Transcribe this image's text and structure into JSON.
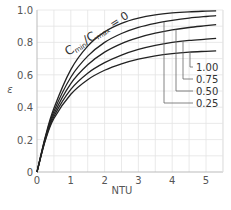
{
  "chart_data": {
    "type": "line",
    "title": "",
    "xlabel": "NTU",
    "ylabel": "ε",
    "xlim": [
      0,
      5.5
    ],
    "ylim": [
      0,
      1.0
    ],
    "grid": true,
    "x_ticks": [
      "0",
      "1",
      "2",
      "3",
      "4",
      "5"
    ],
    "y_ticks": [
      "0",
      "0.2",
      "0.4",
      "0.6",
      "0.8",
      "1.0"
    ],
    "annotation": "Cmin/Cmax = 0",
    "x": [
      0,
      0.25,
      0.5,
      1,
      1.5,
      2,
      2.5,
      3,
      3.5,
      4,
      4.5,
      5,
      5.3
    ],
    "series": [
      {
        "name": "0",
        "values": [
          0,
          0.221,
          0.393,
          0.632,
          0.777,
          0.865,
          0.918,
          0.95,
          0.97,
          0.982,
          0.989,
          0.993,
          0.995
        ]
      },
      {
        "name": "0.25",
        "values": [
          0,
          0.215,
          0.375,
          0.585,
          0.715,
          0.8,
          0.855,
          0.893,
          0.918,
          0.936,
          0.95,
          0.96,
          0.965
        ]
      },
      {
        "name": "0.50",
        "values": [
          0,
          0.209,
          0.358,
          0.546,
          0.662,
          0.74,
          0.793,
          0.83,
          0.857,
          0.877,
          0.892,
          0.903,
          0.91
        ]
      },
      {
        "name": "0.75",
        "values": [
          0,
          0.203,
          0.343,
          0.51,
          0.61,
          0.675,
          0.722,
          0.757,
          0.782,
          0.8,
          0.812,
          0.82,
          0.825
        ]
      },
      {
        "name": "1.00",
        "values": [
          0,
          0.197,
          0.33,
          0.48,
          0.57,
          0.628,
          0.668,
          0.697,
          0.717,
          0.731,
          0.74,
          0.745,
          0.748
        ]
      }
    ],
    "legend_labels": [
      "1.00",
      "0.75",
      "0.50",
      "0.25"
    ]
  }
}
